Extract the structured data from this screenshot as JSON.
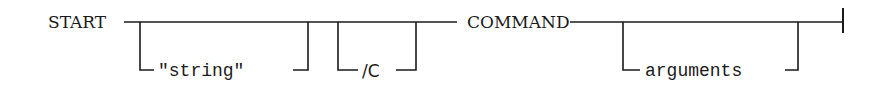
{
  "diagram": {
    "type": "syntax-railroad",
    "start_keyword": "START",
    "optional_items": [
      {
        "id": "string",
        "label": "\"string\""
      },
      {
        "id": "c-switch",
        "label": "/C"
      }
    ],
    "command": "COMMAND",
    "optional_trailing": {
      "id": "arguments",
      "label": "arguments"
    },
    "terminator": "end-bar",
    "colors": {
      "ink": "#1a1a1a",
      "background": "#ffffff"
    }
  }
}
